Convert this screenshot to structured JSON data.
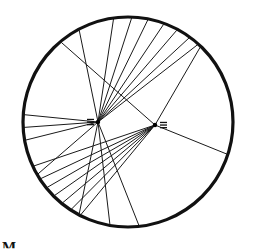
{
  "diagram": {
    "colors": {
      "rim": "#111111",
      "line": "#1a1a1a",
      "background": "#ffffff"
    },
    "hubs": [
      {
        "id": "hub-a",
        "label": "≡",
        "label_side": "left"
      },
      {
        "id": "hub-b",
        "label": "≡",
        "label_side": "right"
      }
    ],
    "rim_angles_deg": {
      "hub-a": [
        -118,
        -98,
        -88,
        -79,
        -70,
        -62,
        -54,
        -48,
        170,
        177,
        184,
        150,
        100,
        84,
        118
      ],
      "hub-b": [
        -130,
        -46,
        18,
        155,
        147,
        141,
        135,
        129,
        123,
        117
      ]
    },
    "caption": "M"
  }
}
